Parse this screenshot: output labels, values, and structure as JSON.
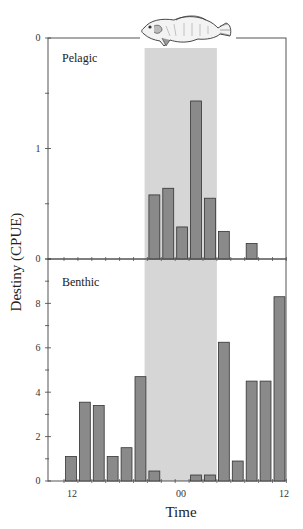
{
  "chart_data": [
    {
      "type": "bar",
      "panel": "Pelagic",
      "title": "Pelagic",
      "xlabel": "Time",
      "ylabel": "Destiny (CPUE)",
      "x_tick_labels": [
        "12",
        "00",
        "12"
      ],
      "y_tick_labels": [
        "0",
        "1",
        "0"
      ],
      "ylim": [
        0,
        2
      ],
      "slots": 16,
      "values": [
        0,
        0,
        0,
        0,
        0,
        0,
        0.58,
        0.64,
        0.29,
        1.43,
        0.55,
        0.25,
        0,
        0.14,
        0,
        0
      ],
      "shaded_region_slots": [
        5.8,
        11.0
      ],
      "grid": false
    },
    {
      "type": "bar",
      "panel": "Benthic",
      "title": "Benthic",
      "xlabel": "Time",
      "ylabel": "Destiny (CPUE)",
      "x_tick_labels": [
        "12",
        "00",
        "12"
      ],
      "y_tick_labels": [
        "0",
        "2",
        "4",
        "6",
        "8",
        "0"
      ],
      "ylim": [
        0,
        10
      ],
      "slots": 16,
      "values": [
        1.1,
        3.55,
        3.4,
        1.1,
        1.5,
        4.7,
        0.45,
        0,
        0,
        0.27,
        0.27,
        6.25,
        0.9,
        4.5,
        4.5,
        8.3
      ],
      "shaded_region_slots": [
        5.8,
        11.0
      ],
      "grid": false
    }
  ],
  "labels": {
    "ylabel": "Destiny (CPUE)",
    "xlabel": "Time",
    "pelagic": "Pelagic",
    "benthic": "Benthic",
    "x_ticks": [
      "12",
      "00",
      "12"
    ],
    "pelagic_y_ticks": [
      "0",
      "1",
      "0"
    ],
    "benthic_y_ticks": [
      "0",
      "2",
      "4",
      "6",
      "8",
      "0"
    ]
  },
  "icons": {
    "fish": "fish-illustration"
  },
  "colors": {
    "bar": "#8a8a8a",
    "bar_stroke": "#333333",
    "shade": "#d6d6d6",
    "axis": "#444444"
  }
}
